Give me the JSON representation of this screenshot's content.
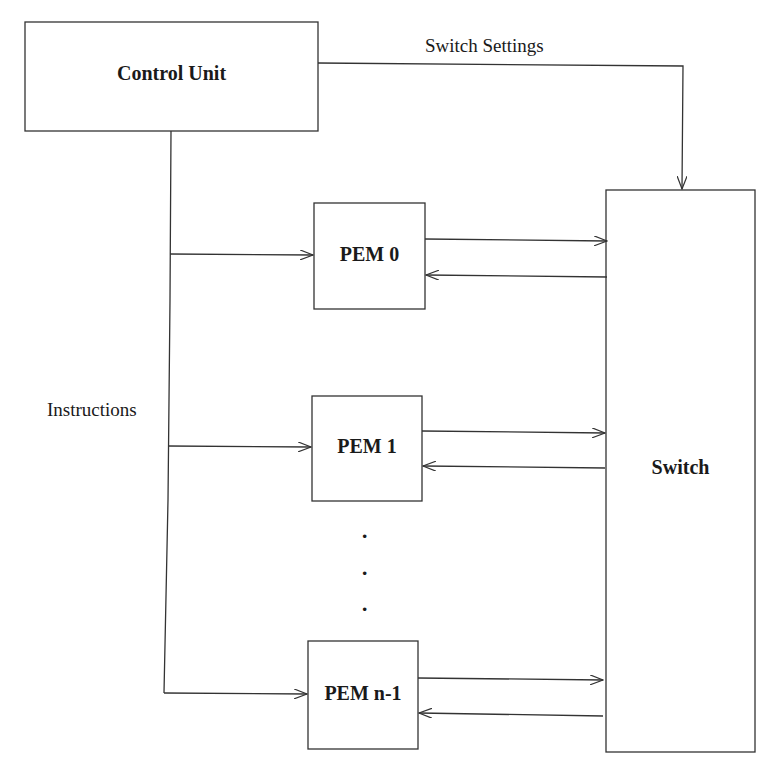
{
  "diagram": {
    "type": "block-diagram",
    "nodes": {
      "control_unit": "Control Unit",
      "switch": "Switch",
      "pem0": "PEM 0",
      "pem1": "PEM 1",
      "pemn1": "PEM n-1"
    },
    "edge_labels": {
      "switch_settings": "Switch Settings",
      "instructions": "Instructions"
    },
    "ellipsis": [
      "·",
      "·",
      "·"
    ],
    "edges": [
      {
        "from": "Control Unit",
        "to": "Switch",
        "label": "Switch Settings"
      },
      {
        "from": "Control Unit",
        "to": "PEM 0",
        "label": "Instructions"
      },
      {
        "from": "Control Unit",
        "to": "PEM 1",
        "label": "Instructions"
      },
      {
        "from": "Control Unit",
        "to": "PEM n-1",
        "label": "Instructions"
      },
      {
        "from": "PEM 0",
        "to": "Switch"
      },
      {
        "from": "Switch",
        "to": "PEM 0"
      },
      {
        "from": "PEM 1",
        "to": "Switch"
      },
      {
        "from": "Switch",
        "to": "PEM 1"
      },
      {
        "from": "PEM n-1",
        "to": "Switch"
      },
      {
        "from": "Switch",
        "to": "PEM n-1"
      }
    ],
    "line_color": "#333333"
  }
}
